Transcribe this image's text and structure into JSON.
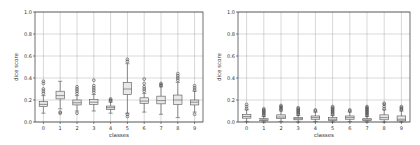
{
  "chart_data": [
    {
      "type": "box",
      "title": "",
      "xlabel": "classes",
      "ylabel": "dice score",
      "ylim": [
        0.0,
        1.0
      ],
      "yticks": [
        "0.0",
        "0.2",
        "0.4",
        "0.6",
        "0.8",
        "1.0"
      ],
      "categories": [
        "0",
        "1",
        "2",
        "3",
        "4",
        "5",
        "6",
        "7",
        "8",
        "9"
      ],
      "grid": true,
      "boxes": [
        {
          "class": "0",
          "whislo": 0.08,
          "q1": 0.14,
          "med": 0.16,
          "q3": 0.185,
          "whishi": 0.24,
          "fliers": [
            0.26,
            0.28,
            0.3,
            0.35,
            0.37
          ]
        },
        {
          "class": "1",
          "whislo": 0.12,
          "q1": 0.21,
          "med": 0.24,
          "q3": 0.28,
          "whishi": 0.37,
          "fliers": [
            0.08,
            0.09
          ]
        },
        {
          "class": "2",
          "whislo": 0.1,
          "q1": 0.155,
          "med": 0.175,
          "q3": 0.2,
          "whishi": 0.24,
          "fliers": [
            0.08,
            0.26,
            0.28,
            0.3,
            0.32
          ]
        },
        {
          "class": "3",
          "whislo": 0.1,
          "q1": 0.16,
          "med": 0.18,
          "q3": 0.205,
          "whishi": 0.25,
          "fliers": [
            0.27,
            0.29,
            0.31,
            0.33,
            0.38
          ]
        },
        {
          "class": "4",
          "whislo": 0.08,
          "q1": 0.115,
          "med": 0.13,
          "q3": 0.145,
          "whishi": 0.18,
          "fliers": [
            0.19,
            0.2,
            0.21
          ]
        },
        {
          "class": "5",
          "whislo": 0.08,
          "q1": 0.25,
          "med": 0.3,
          "q3": 0.36,
          "whishi": 0.53,
          "fliers": [
            0.05,
            0.07,
            0.55,
            0.57
          ]
        },
        {
          "class": "6",
          "whislo": 0.09,
          "q1": 0.17,
          "med": 0.19,
          "q3": 0.22,
          "whishi": 0.26,
          "fliers": [
            0.28,
            0.3,
            0.32,
            0.35,
            0.39
          ]
        },
        {
          "class": "7",
          "whislo": 0.07,
          "q1": 0.165,
          "med": 0.195,
          "q3": 0.235,
          "whishi": 0.32,
          "fliers": [
            0.33,
            0.34,
            0.35
          ]
        },
        {
          "class": "8",
          "whislo": 0.04,
          "q1": 0.16,
          "med": 0.2,
          "q3": 0.245,
          "whishi": 0.36,
          "fliers": [
            0.38,
            0.4,
            0.42,
            0.44
          ]
        },
        {
          "class": "9",
          "whislo": 0.09,
          "q1": 0.155,
          "med": 0.18,
          "q3": 0.2,
          "whishi": 0.28,
          "fliers": [
            0.07,
            0.29,
            0.31,
            0.33
          ]
        }
      ]
    },
    {
      "type": "box",
      "title": "",
      "xlabel": "classes",
      "ylabel": "dice score",
      "ylim": [
        0.0,
        1.0
      ],
      "yticks": [
        "0.0",
        "0.2",
        "0.4",
        "0.6",
        "0.8",
        "1.0"
      ],
      "categories": [
        "0",
        "1",
        "2",
        "3",
        "4",
        "5",
        "6",
        "7",
        "8",
        "9"
      ],
      "grid": true,
      "boxes": [
        {
          "class": "0",
          "whislo": 0.005,
          "q1": 0.035,
          "med": 0.05,
          "q3": 0.07,
          "whishi": 0.11,
          "fliers": [
            0.12,
            0.14,
            0.16
          ]
        },
        {
          "class": "1",
          "whislo": 0.0,
          "q1": 0.015,
          "med": 0.02,
          "q3": 0.03,
          "whishi": 0.05,
          "fliers": [
            0.06,
            0.07,
            0.08,
            0.09,
            0.1,
            0.11,
            0.12
          ]
        },
        {
          "class": "2",
          "whislo": 0.005,
          "q1": 0.03,
          "med": 0.045,
          "q3": 0.065,
          "whishi": 0.1,
          "fliers": [
            0.11,
            0.12,
            0.13,
            0.14,
            0.15
          ]
        },
        {
          "class": "3",
          "whislo": 0.0,
          "q1": 0.02,
          "med": 0.03,
          "q3": 0.04,
          "whishi": 0.06,
          "fliers": [
            0.07,
            0.08,
            0.09,
            0.1,
            0.11,
            0.12,
            0.13
          ]
        },
        {
          "class": "4",
          "whislo": 0.005,
          "q1": 0.025,
          "med": 0.04,
          "q3": 0.055,
          "whishi": 0.09,
          "fliers": [
            0.1,
            0.11
          ]
        },
        {
          "class": "5",
          "whislo": 0.0,
          "q1": 0.015,
          "med": 0.025,
          "q3": 0.04,
          "whishi": 0.06,
          "fliers": [
            0.07,
            0.08,
            0.09,
            0.1,
            0.11,
            0.12,
            0.13,
            0.14
          ]
        },
        {
          "class": "6",
          "whislo": 0.005,
          "q1": 0.025,
          "med": 0.04,
          "q3": 0.055,
          "whishi": 0.09,
          "fliers": [
            0.1,
            0.11
          ]
        },
        {
          "class": "7",
          "whislo": 0.0,
          "q1": 0.015,
          "med": 0.02,
          "q3": 0.03,
          "whishi": 0.05,
          "fliers": [
            0.06,
            0.07,
            0.08,
            0.09,
            0.1,
            0.11,
            0.12,
            0.13,
            0.14
          ]
        },
        {
          "class": "8",
          "whislo": 0.0,
          "q1": 0.02,
          "med": 0.04,
          "q3": 0.065,
          "whishi": 0.11,
          "fliers": [
            0.12,
            0.14,
            0.16,
            0.17
          ]
        },
        {
          "class": "9",
          "whislo": 0.0,
          "q1": 0.01,
          "med": 0.025,
          "q3": 0.055,
          "whishi": 0.1,
          "fliers": [
            0.11,
            0.12,
            0.13,
            0.14
          ]
        }
      ]
    }
  ],
  "colors": {
    "box_face": "#e8e8e8",
    "box_edge": "#555555",
    "grid": "#b0b0b0",
    "axis": "#333333",
    "text": "#333333"
  }
}
